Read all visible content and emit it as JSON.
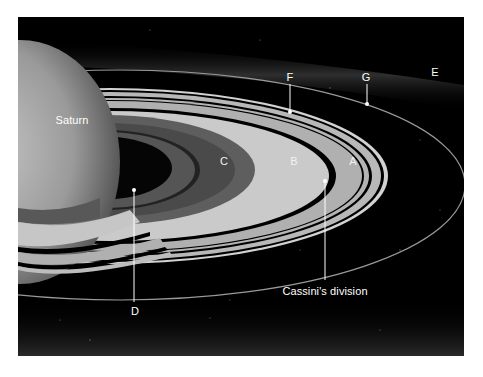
{
  "diagram": {
    "labels": {
      "saturn": "Saturn",
      "ring_a": "A",
      "ring_b": "B",
      "ring_c": "C",
      "ring_d": "D",
      "ring_e": "E",
      "ring_f": "F",
      "ring_g": "G",
      "cassini": "Cassini's division"
    },
    "colors": {
      "space": "#000000",
      "planet": "#a8a8a8",
      "ring_b": "#c8c8c8",
      "ring_a": "#b4b4b4",
      "ring_c": "#5c5c5c",
      "leader_line": "#ffffff"
    }
  }
}
